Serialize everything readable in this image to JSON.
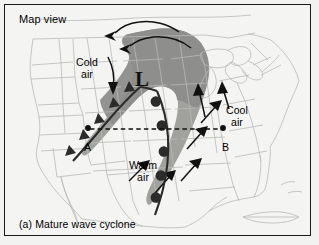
{
  "figure": {
    "caption": "(a) Mature wave cyclone",
    "map_view_label": "Map view",
    "background_color": "#f4f4f2",
    "border_color": "#1a1a1a"
  },
  "map": {
    "region": "North America",
    "outline_color": "#b9b9b6",
    "precip_shade_color": "#9a9a98",
    "precip_shade_color_dark": "#8a8a88"
  },
  "annotations": {
    "low_center": {
      "symbol": "L",
      "name": "low-pressure-center",
      "x": 138,
      "y": 74
    },
    "air_masses": [
      {
        "id": "cold",
        "line1": "Cold",
        "line2": "air",
        "x": 71,
        "y": 52
      },
      {
        "id": "cool",
        "line1": "Cool",
        "line2": "air",
        "x": 221,
        "y": 100
      },
      {
        "id": "warm",
        "line1": "Warm",
        "line2": "air",
        "x": 124,
        "y": 155
      }
    ],
    "cross_section": {
      "point_a_label": "A",
      "point_b_label": "B",
      "point_a": {
        "x": 87,
        "y": 128
      },
      "point_b": {
        "x": 222,
        "y": 128
      },
      "line_style": "dashed"
    },
    "fronts": [
      {
        "id": "cold-front",
        "type": "cold",
        "symbol": "triangles",
        "symbol_count": 5,
        "color": "#2b2b2b",
        "description": "Cold front trailing southwest from the low"
      },
      {
        "id": "warm-front",
        "type": "warm",
        "symbol": "semicircles",
        "symbol_count": 5,
        "color": "#2b2b2b",
        "description": "Warm front trailing south-southeast from the low"
      }
    ],
    "flow_arrows": [
      {
        "id": "cold-air-flow",
        "direction": "south",
        "count": 1
      },
      {
        "id": "cyclonic-rotation",
        "direction": "counterclockwise",
        "count": 2
      },
      {
        "id": "cool-air-flow",
        "direction": "north",
        "count": 2
      },
      {
        "id": "warm-air-flow",
        "direction": "northeast",
        "count": 4
      }
    ]
  }
}
